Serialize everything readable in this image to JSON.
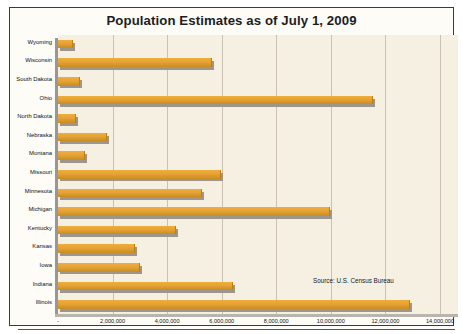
{
  "chart_data": {
    "type": "bar",
    "orientation": "horizontal",
    "title": "Population Estimates as of July 1, 2009",
    "xlabel": "",
    "ylabel": "",
    "xlim": [
      0,
      14000000
    ],
    "grid": true,
    "legend": "none",
    "annotation": "Source: U.S. Census Bureau",
    "zero_tick_label": "-",
    "xtick_labels": [
      "-",
      "2,000,000",
      "4,000,000",
      "6,000,000",
      "8,000,000",
      "10,000,000",
      "12,000,000",
      "14,000,000"
    ],
    "xtick_values": [
      0,
      2000000,
      4000000,
      6000000,
      8000000,
      10000000,
      12000000,
      14000000
    ],
    "categories": [
      "Wyoming",
      "Wisconsin",
      "South Dakota",
      "Ohio",
      "North Dakota",
      "Nebraska",
      "Montana",
      "Missouri",
      "Minnesota",
      "Michigan",
      "Kentucky",
      "Kansas",
      "Iowa",
      "Indiana",
      "Illinois"
    ],
    "values": [
      544270,
      5654774,
      812383,
      11542645,
      646844,
      1796619,
      974989,
      5987580,
      5266214,
      9969727,
      4314113,
      2818747,
      3007856,
      6423113,
      12910409
    ],
    "colors": {
      "bar_fill": "#e6a335",
      "bar_fill_light": "#f0ad3c",
      "bar_fill_dark": "#c98c20",
      "plot_background": "#f6f0e2",
      "gridline": "#c9c2b3",
      "page_background": "#fdfcf6",
      "border": "#3a3a3c",
      "text": "#1d1d1f",
      "shadow": "#9c968c"
    }
  }
}
